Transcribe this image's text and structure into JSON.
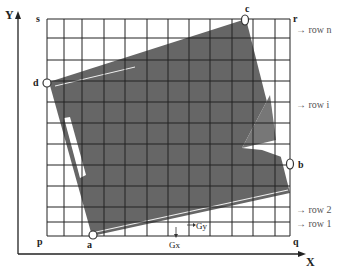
{
  "diagram": {
    "axes": {
      "x_label": "X",
      "y_label": "Y"
    },
    "corners": {
      "p": "p",
      "q": "q",
      "r": "r",
      "s": "s"
    },
    "vertices": {
      "a": "a",
      "b": "b",
      "c": "c",
      "d": "d"
    },
    "row_labels": {
      "row_n": "row n",
      "row_i": "row i",
      "row_2": "row 2",
      "row_1": "row 1"
    },
    "gradients": {
      "gx": "Gx",
      "gy": "Gy"
    },
    "arrow": "→",
    "down_arrow": "↓",
    "colors": {
      "grid": "#222222",
      "shape": "#666666",
      "background": "#ffffff"
    }
  }
}
